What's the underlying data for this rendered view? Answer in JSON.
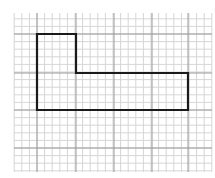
{
  "diagram": {
    "type": "grid-polygon",
    "background": "#ffffff",
    "grid": {
      "x_start": 14,
      "x_end": 212,
      "y_start": 13,
      "y_end": 172,
      "major_x": [
        37,
        76,
        114,
        152,
        188
      ],
      "major_y": [
        34,
        73,
        110,
        148
      ],
      "minor_step": 7.6,
      "major_color": "#9a9a9a",
      "minor_color": "#d6d6d6"
    },
    "shape": {
      "name": "L-shape",
      "points": [
        [
          37,
          34
        ],
        [
          76,
          34
        ],
        [
          76,
          73
        ],
        [
          188,
          73
        ],
        [
          188,
          110
        ],
        [
          37,
          110
        ]
      ],
      "stroke": "#1a1a1a",
      "stroke_width": 2.2
    }
  }
}
